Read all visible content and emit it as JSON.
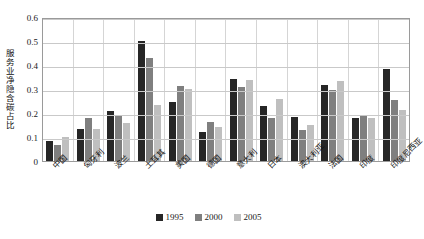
{
  "chart_data": {
    "type": "bar",
    "title": "",
    "xlabel": "",
    "ylabel": "服务业净隐含碳占比",
    "ylim": [
      0,
      0.6
    ],
    "yticks": [
      "0",
      "0.1",
      "0.2",
      "0.3",
      "0.4",
      "0.5",
      "0.6"
    ],
    "grid": true,
    "legend_position": "bottom",
    "categories": [
      "中国",
      "匈牙利",
      "波兰",
      "土耳其",
      "美国",
      "德国",
      "意大利",
      "日本",
      "澳大利亚",
      "法国",
      "印度",
      "印度尼西亚"
    ],
    "series": [
      {
        "name": "1995",
        "color": "#262626",
        "values": [
          0.082,
          0.133,
          0.208,
          0.5,
          0.244,
          0.119,
          0.34,
          0.229,
          0.184,
          0.315,
          0.179,
          0.383
        ]
      },
      {
        "name": "2000",
        "color": "#7f7f7f",
        "values": [
          0.068,
          0.178,
          0.186,
          0.43,
          0.312,
          0.162,
          0.307,
          0.179,
          0.131,
          0.296,
          0.191,
          0.253
        ]
      },
      {
        "name": "2005",
        "color": "#bfbfbf",
        "values": [
          0.098,
          0.135,
          0.158,
          0.232,
          0.3,
          0.14,
          0.337,
          0.258,
          0.148,
          0.333,
          0.178,
          0.214
        ]
      }
    ]
  },
  "legend": {
    "items": [
      {
        "label": "1995"
      },
      {
        "label": "2000"
      },
      {
        "label": "2005"
      }
    ]
  }
}
